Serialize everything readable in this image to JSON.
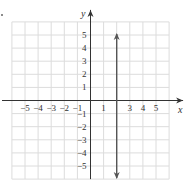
{
  "chart_data": {
    "type": "line",
    "title": "",
    "xlabel": "x",
    "ylabel": "y",
    "xlim": [
      -6,
      6
    ],
    "ylim": [
      -6,
      6
    ],
    "grid": true,
    "x_tick_labels": [
      "−5",
      "−4",
      "−3",
      "−2",
      "−1",
      "1",
      "3",
      "4",
      "5"
    ],
    "x_ticks": [
      -5,
      -4,
      -3,
      -2,
      -1,
      1,
      3,
      4,
      5
    ],
    "y_tick_labels": [
      "5",
      "4",
      "3",
      "2",
      "1",
      "−1",
      "−2",
      "−3",
      "−4",
      "−5"
    ],
    "y_ticks": [
      5,
      4,
      3,
      2,
      1,
      -1,
      -2,
      -3,
      -4,
      -5
    ],
    "series": [
      {
        "name": "x = 2",
        "type": "vertical-line",
        "x": 2,
        "y_range": [
          -6,
          6
        ],
        "arrows": "both",
        "color": "#555555"
      }
    ]
  },
  "colors": {
    "grid": "#dcdcdc",
    "axis": "#333333",
    "line": "#555555"
  }
}
